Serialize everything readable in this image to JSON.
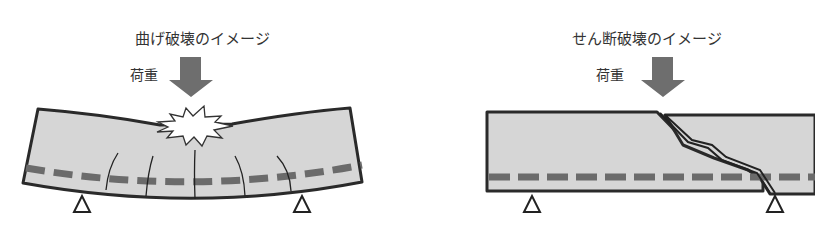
{
  "left_panel": {
    "title": "曲げ破壊のイメージ",
    "load_label": "荷重",
    "failure_type": "bending",
    "icons": [
      "load-arrow-icon",
      "burst-icon",
      "crack-lines",
      "rebar-dashed-line",
      "support-triangle-icon"
    ]
  },
  "right_panel": {
    "title": "せん断破壊のイメージ",
    "load_label": "荷重",
    "failure_type": "shear",
    "icons": [
      "load-arrow-icon",
      "diagonal-crack",
      "rebar-dashed-line",
      "support-triangle-icon"
    ]
  },
  "colors": {
    "beam_fill": "#d6d6d6",
    "beam_outline": "#2a2a2a",
    "rebar": "#6b6b6b",
    "arrow": "#6e6e6e",
    "text": "#333333"
  }
}
